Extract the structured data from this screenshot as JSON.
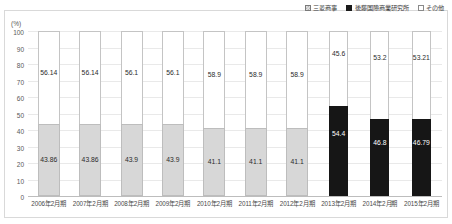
{
  "top_cropped_text": "",
  "axis": {
    "unit_label": "(%)",
    "yticks": [
      "100",
      "90",
      "80",
      "70",
      "60",
      "50",
      "40",
      "30",
      "20",
      "10",
      "0"
    ]
  },
  "legend": {
    "items": [
      {
        "label": "三菱商事",
        "marker": "checker-swatch",
        "color": "#d7d7d7"
      },
      {
        "label": "後藤国際商業研究所",
        "marker": "solid-swatch",
        "color": "#161616"
      },
      {
        "label": "その他",
        "marker": "white-swatch",
        "color": "#ffffff"
      }
    ]
  },
  "chart_data": {
    "type": "bar",
    "subtype": "stacked-100-percent",
    "title": "",
    "xlabel": "",
    "ylabel": "(%)",
    "ylim": [
      0,
      100
    ],
    "ytick_step": 10,
    "grid": true,
    "legend_position": "top-right",
    "categories": [
      "2006年2月期",
      "2007年2月期",
      "2008年2月期",
      "2009年2月期",
      "2010年2月期",
      "2011年2月期",
      "2012年2月期",
      "2013年2月期",
      "2014年2月期",
      "2015年2月期"
    ],
    "series": [
      {
        "name": "三菱商事",
        "color": "#d7d7d7",
        "values": [
          43.86,
          43.86,
          43.9,
          43.9,
          41.1,
          41.1,
          41.1,
          null,
          null,
          null
        ]
      },
      {
        "name": "後藤国際商業研究所",
        "color": "#161616",
        "values": [
          null,
          null,
          null,
          null,
          null,
          null,
          null,
          54.4,
          46.8,
          46.79
        ]
      },
      {
        "name": "その他",
        "color": "#ffffff",
        "values": [
          56.14,
          56.14,
          56.1,
          56.1,
          58.9,
          58.9,
          58.9,
          45.6,
          53.2,
          53.21
        ]
      }
    ]
  },
  "bars": [
    {
      "category": "2006年2月期",
      "bottom_label": "43.86",
      "bottom_value": 43.86,
      "bottom_style": "gray",
      "top_label": "56.14",
      "top_value": 56.14
    },
    {
      "category": "2007年2月期",
      "bottom_label": "43.86",
      "bottom_value": 43.86,
      "bottom_style": "gray",
      "top_label": "56.14",
      "top_value": 56.14
    },
    {
      "category": "2008年2月期",
      "bottom_label": "43.9",
      "bottom_value": 43.9,
      "bottom_style": "gray",
      "top_label": "56.1",
      "top_value": 56.1
    },
    {
      "category": "2009年2月期",
      "bottom_label": "43.9",
      "bottom_value": 43.9,
      "bottom_style": "gray",
      "top_label": "56.1",
      "top_value": 56.1
    },
    {
      "category": "2010年2月期",
      "bottom_label": "41.1",
      "bottom_value": 41.1,
      "bottom_style": "gray",
      "top_label": "58.9",
      "top_value": 58.9
    },
    {
      "category": "2011年2月期",
      "bottom_label": "41.1",
      "bottom_value": 41.1,
      "bottom_style": "gray",
      "top_label": "58.9",
      "top_value": 58.9
    },
    {
      "category": "2012年2月期",
      "bottom_label": "41.1",
      "bottom_value": 41.1,
      "bottom_style": "gray",
      "top_label": "58.9",
      "top_value": 58.9
    },
    {
      "category": "2013年2月期",
      "bottom_label": "54.4",
      "bottom_value": 54.4,
      "bottom_style": "black",
      "top_label": "45.6",
      "top_value": 45.6
    },
    {
      "category": "2014年2月期",
      "bottom_label": "46.8",
      "bottom_value": 46.8,
      "bottom_style": "black",
      "top_label": "53.2",
      "top_value": 53.2
    },
    {
      "category": "2015年2月期",
      "bottom_label": "46.79",
      "bottom_value": 46.79,
      "bottom_style": "black",
      "top_label": "53.21",
      "top_value": 53.21
    }
  ]
}
